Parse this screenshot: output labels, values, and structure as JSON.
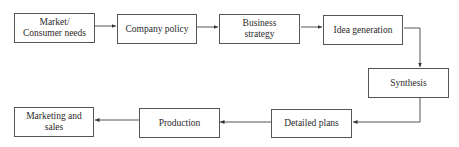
{
  "diagram": {
    "type": "flowchart",
    "nodes": [
      {
        "id": "market",
        "label": "Market/\nConsumer needs",
        "line1": "Market/",
        "line2": "Consumer needs"
      },
      {
        "id": "company_policy",
        "label": "Company policy"
      },
      {
        "id": "business_strategy",
        "label": "Business strategy",
        "line1": "Business",
        "line2": "strategy"
      },
      {
        "id": "idea_generation",
        "label": "Idea generation"
      },
      {
        "id": "synthesis",
        "label": "Synthesis"
      },
      {
        "id": "detailed_plans",
        "label": "Detailed plans"
      },
      {
        "id": "production",
        "label": "Production"
      },
      {
        "id": "marketing_sales",
        "label": "Marketing and sales",
        "line1": "Marketing and",
        "line2": "sales"
      }
    ],
    "edges": [
      {
        "from": "market",
        "to": "company_policy"
      },
      {
        "from": "company_policy",
        "to": "business_strategy"
      },
      {
        "from": "business_strategy",
        "to": "idea_generation"
      },
      {
        "from": "idea_generation",
        "to": "synthesis"
      },
      {
        "from": "synthesis",
        "to": "detailed_plans"
      },
      {
        "from": "detailed_plans",
        "to": "production"
      },
      {
        "from": "production",
        "to": "marketing_sales"
      }
    ],
    "colors": {
      "stroke": "#555555",
      "text": "#2a2a2a",
      "background": "#ffffff"
    }
  }
}
